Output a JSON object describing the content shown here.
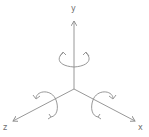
{
  "diagram": {
    "stroke_color": "#8c8c8c",
    "label_color": "#6f6f6f",
    "origin": [
      74,
      89
    ],
    "axes": [
      {
        "name": "y",
        "label": "y",
        "end": [
          74,
          21
        ],
        "label_pos": [
          71,
          5
        ]
      },
      {
        "name": "z",
        "label": "z",
        "end": [
          13,
          121
        ],
        "label_pos": [
          3,
          124
        ]
      },
      {
        "name": "x",
        "label": "x",
        "end": [
          135,
          121
        ],
        "label_pos": [
          138,
          124
        ]
      }
    ],
    "rotations": [
      {
        "axis": "y",
        "icon": "rotation-arrow-icon"
      },
      {
        "axis": "z",
        "icon": "rotation-arrow-icon"
      },
      {
        "axis": "x",
        "icon": "rotation-arrow-icon"
      }
    ]
  }
}
